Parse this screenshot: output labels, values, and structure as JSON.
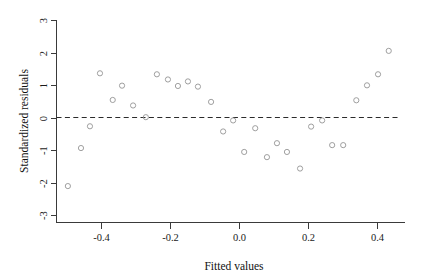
{
  "chart_data": {
    "type": "scatter",
    "title": "",
    "xlabel": "Fitted values",
    "ylabel": "Standardized residuals",
    "xlim": [
      -0.53,
      0.48
    ],
    "ylim": [
      -3.2,
      3.2
    ],
    "grid": false,
    "legend": "none",
    "marker": "open-circle",
    "marker_color": "#9a9a9a",
    "reference_line": {
      "type": "horizontal",
      "y": 0,
      "style": "dashed",
      "color": "#2b2b2b"
    },
    "xticks": [
      -0.4,
      -0.2,
      0.0,
      0.2,
      0.4
    ],
    "xtick_labels": [
      "-0.4",
      "-0.2",
      "0.0",
      "0.2",
      "0.4"
    ],
    "yticks": [
      -3,
      -2,
      -1,
      0,
      1,
      2,
      3
    ],
    "ytick_labels": [
      "-3",
      "-2",
      "-1",
      "0",
      "1",
      "2",
      "3"
    ],
    "n_points": 37,
    "points": [
      {
        "x": -0.496,
        "y": -2.11
      },
      {
        "x": -0.458,
        "y": -0.94
      },
      {
        "x": -0.432,
        "y": -0.27
      },
      {
        "x": -0.403,
        "y": 1.36
      },
      {
        "x": -0.366,
        "y": 0.54
      },
      {
        "x": -0.339,
        "y": 0.98
      },
      {
        "x": -0.307,
        "y": 0.37
      },
      {
        "x": -0.27,
        "y": 0.01
      },
      {
        "x": -0.238,
        "y": 1.33
      },
      {
        "x": -0.206,
        "y": 1.17
      },
      {
        "x": -0.177,
        "y": 0.97
      },
      {
        "x": -0.148,
        "y": 1.11
      },
      {
        "x": -0.119,
        "y": 0.95
      },
      {
        "x": -0.081,
        "y": 0.48
      },
      {
        "x": -0.046,
        "y": -0.43
      },
      {
        "x": -0.017,
        "y": -0.09
      },
      {
        "x": 0.015,
        "y": -1.06
      },
      {
        "x": 0.047,
        "y": -0.33
      },
      {
        "x": 0.081,
        "y": -1.22
      },
      {
        "x": 0.11,
        "y": -0.79
      },
      {
        "x": 0.139,
        "y": -1.06
      },
      {
        "x": 0.177,
        "y": -1.57
      },
      {
        "x": 0.209,
        "y": -0.28
      },
      {
        "x": 0.241,
        "y": -0.09
      },
      {
        "x": 0.27,
        "y": -0.85
      },
      {
        "x": 0.302,
        "y": -0.85
      },
      {
        "x": 0.34,
        "y": 0.53
      },
      {
        "x": 0.371,
        "y": 0.99
      },
      {
        "x": 0.403,
        "y": 1.33
      },
      {
        "x": 0.434,
        "y": 2.05
      }
    ]
  }
}
